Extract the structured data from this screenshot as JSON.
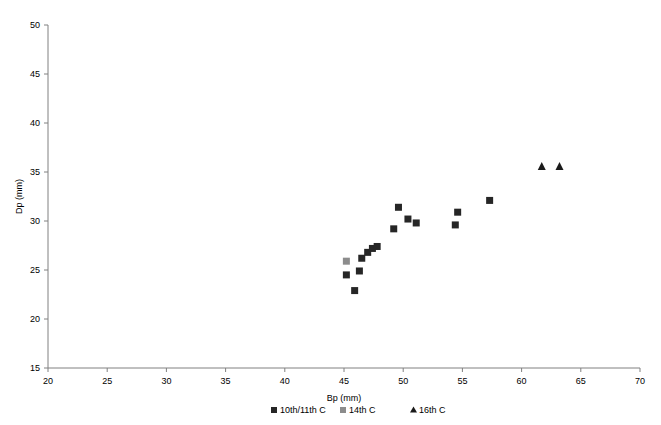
{
  "chart_data": {
    "type": "scatter",
    "title": "",
    "xlabel": "Bp (mm)",
    "ylabel": "Dp (mm)",
    "xlim": [
      20,
      70
    ],
    "ylim": [
      15,
      50
    ],
    "xticks": [
      20,
      25,
      30,
      35,
      40,
      45,
      50,
      55,
      60,
      65,
      70
    ],
    "yticks": [
      15,
      20,
      25,
      30,
      35,
      40,
      45,
      50
    ],
    "grid": false,
    "legend_position": "bottom",
    "series": [
      {
        "name": "10th/11th C",
        "marker": "square",
        "color": "#262626",
        "points": [
          [
            45.2,
            24.5
          ],
          [
            45.9,
            22.9
          ],
          [
            46.5,
            26.2
          ],
          [
            46.3,
            24.9
          ],
          [
            47.0,
            26.8
          ],
          [
            47.4,
            27.2
          ],
          [
            47.8,
            27.4
          ],
          [
            49.2,
            29.2
          ],
          [
            49.6,
            31.4
          ],
          [
            50.4,
            30.2
          ],
          [
            51.1,
            29.8
          ],
          [
            54.4,
            29.6
          ],
          [
            54.6,
            30.9
          ],
          [
            57.3,
            32.1
          ]
        ]
      },
      {
        "name": "14th C",
        "marker": "square",
        "color": "#8c8c8c",
        "points": [
          [
            45.2,
            25.9
          ]
        ]
      },
      {
        "name": "16th C",
        "marker": "triangle",
        "color": "#1a1a1a",
        "points": [
          [
            61.7,
            35.6
          ],
          [
            63.2,
            35.6
          ]
        ]
      }
    ]
  },
  "axes": {
    "x_title": "Bp (mm)",
    "y_title": "Dp (mm)",
    "x_tick_labels": [
      "20",
      "25",
      "30",
      "35",
      "40",
      "45",
      "50",
      "55",
      "60",
      "65",
      "70"
    ],
    "y_tick_labels": [
      "15",
      "20",
      "25",
      "30",
      "35",
      "40",
      "45",
      "50"
    ]
  },
  "legend": {
    "items": [
      {
        "label": "10th/11th C",
        "marker": "square",
        "color": "#262626"
      },
      {
        "label": "14th C",
        "marker": "square",
        "color": "#8c8c8c"
      },
      {
        "label": "16th C",
        "marker": "triangle",
        "color": "#1a1a1a"
      }
    ]
  }
}
